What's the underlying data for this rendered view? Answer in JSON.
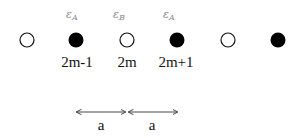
{
  "diagram": {
    "sites": [
      {
        "x": 27,
        "filled": false
      },
      {
        "x": 76,
        "filled": true,
        "energy_label": "ε",
        "energy_sub": "A",
        "index_label": "2m-1"
      },
      {
        "x": 127,
        "filled": false,
        "energy_label": "ε",
        "energy_sub": "B",
        "index_label": "2m"
      },
      {
        "x": 177,
        "filled": true,
        "energy_label": "ε",
        "energy_sub": "A",
        "index_label": "2m+1"
      },
      {
        "x": 228,
        "filled": false
      },
      {
        "x": 278,
        "filled": true
      }
    ],
    "spacing": [
      {
        "label": "a",
        "from": 76,
        "to": 127
      },
      {
        "label": "a",
        "from": 127,
        "to": 177
      }
    ],
    "colors": {
      "filled": "#000000",
      "open_stroke": "#111111",
      "energy_text": "#888888"
    }
  }
}
